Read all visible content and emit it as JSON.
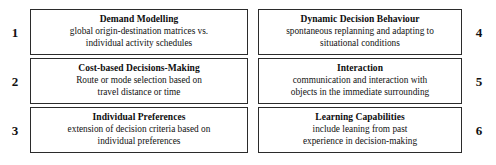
{
  "diagram": {
    "type": "numbered-box-grid",
    "columns": 2,
    "rows": 3,
    "border_color": "#2b2b2b",
    "background_color": "#ffffff",
    "text_color": "#111111",
    "items": [
      {
        "number": "1",
        "number_side": "left",
        "title": "Demand Modelling",
        "desc_line1": "global origin-destination matrices vs.",
        "desc_line2": "individual activity schedules"
      },
      {
        "number": "4",
        "number_side": "right",
        "title": "Dynamic Decision Behaviour",
        "desc_line1": "spontaneous replanning and adapting to",
        "desc_line2": "situational conditions"
      },
      {
        "number": "2",
        "number_side": "left",
        "title": "Cost-based Decisions-Making",
        "desc_line1": "Route or mode selection based on",
        "desc_line2": "travel distance or time"
      },
      {
        "number": "5",
        "number_side": "right",
        "title": "Interaction",
        "desc_line1": "communication and interaction with",
        "desc_line2": "objects in the immediate surrounding"
      },
      {
        "number": "3",
        "number_side": "left",
        "title": "Individual Preferences",
        "desc_line1": "extension of decision criteria based on",
        "desc_line2": "individual preferences"
      },
      {
        "number": "6",
        "number_side": "right",
        "title": "Learning Capabilities",
        "desc_line1": "include leaning from past",
        "desc_line2": "experience in decision-making"
      }
    ]
  }
}
